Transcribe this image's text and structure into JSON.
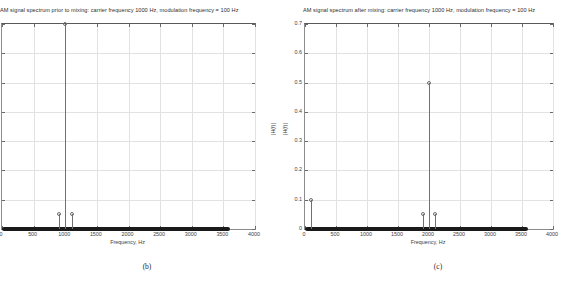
{
  "figure": {
    "caption_b": "(b)",
    "caption_c": "(c)"
  },
  "chart_data": [
    {
      "type": "scatter",
      "panel": "b",
      "title": "AM signal spectrum prior to mixing: carrier frequency 1000 Hz, modulation frequency = 100 Hz",
      "xlabel": "Frequency, Hz",
      "ylabel": "|H(f)|",
      "ylabel_side": "right",
      "xlim": [
        0,
        4000
      ],
      "ylim": [
        0,
        0.7
      ],
      "xticks": [
        0,
        500,
        1000,
        1500,
        2000,
        2500,
        3000,
        3500,
        4000
      ],
      "xticklabels": [
        "0",
        "500",
        "1000",
        "1500",
        "2000",
        "2500",
        "3000",
        "3500",
        "4000"
      ],
      "yticks": [
        0,
        0.1,
        0.2,
        0.3,
        0.4,
        0.5,
        0.6,
        0.7
      ],
      "yticklabels": [
        "",
        "",
        "",
        "",
        "",
        "",
        "",
        ""
      ],
      "grid": true,
      "legend": "none",
      "marker": "open-circle",
      "series": [
        {
          "name": "AM spectrum before mixing",
          "x": [
            900,
            1000,
            1100
          ],
          "y": [
            0.05,
            0.7,
            0.05
          ]
        }
      ],
      "baseline": {
        "from": 0,
        "to": 3600,
        "value": 0
      }
    },
    {
      "type": "scatter",
      "panel": "c",
      "title": "AM signal spectrum after mixing: carrier frequency 1000 Hz, modulation frequency = 100 Hz",
      "xlabel": "Frequency, Hz",
      "ylabel": "|H(f)|",
      "ylabel_side": "left",
      "xlim": [
        0,
        4000
      ],
      "ylim": [
        0,
        0.7
      ],
      "xticks": [
        0,
        500,
        1000,
        1500,
        2000,
        2500,
        3000,
        3500,
        4000
      ],
      "xticklabels": [
        "0",
        "500",
        "1000",
        "1500",
        "2000",
        "2500",
        "3000",
        "3500",
        "4000"
      ],
      "yticks": [
        0,
        0.1,
        0.2,
        0.3,
        0.4,
        0.5,
        0.6,
        0.7
      ],
      "yticklabels": [
        "0",
        "0.1",
        "0.2",
        "0.3",
        "0.4",
        "0.5",
        "0.6",
        "0.7"
      ],
      "grid": true,
      "legend": "none",
      "marker": "open-circle",
      "series": [
        {
          "name": "AM spectrum after mixing",
          "x": [
            100,
            1900,
            2000,
            2100
          ],
          "y": [
            0.1,
            0.05,
            0.5,
            0.05
          ]
        }
      ],
      "baseline": {
        "from": 0,
        "to": 3600,
        "value": 0
      }
    }
  ]
}
